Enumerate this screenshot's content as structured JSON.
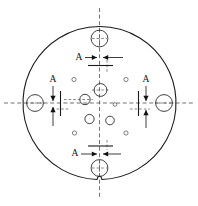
{
  "drawing": {
    "title": "Circular flange hole-pattern section drawing",
    "canvas": {
      "width": 198,
      "height": 206,
      "background": "#ffffff"
    },
    "colors": {
      "outline": "#1a1a1a",
      "hole": "#2b2b2b",
      "small_hole": "#555555",
      "centerline": "#444444",
      "arrow": "#111111",
      "text": "#111111"
    },
    "outer_circle": {
      "name": "flange-outline",
      "cx": 99.5,
      "cy": 103,
      "r": 76.5,
      "notch": {
        "present": true,
        "position": "bottom",
        "width": 5,
        "depth": 3
      }
    },
    "centerlines": {
      "horizontal": {
        "y": 103,
        "x1": 4,
        "x2": 195
      },
      "vertical": {
        "x": 99.5,
        "y1": 8,
        "y2": 199
      }
    },
    "medium_holes": [
      {
        "name": "hole-top",
        "cx": 99.5,
        "cy": 38.5,
        "r": 8.4
      },
      {
        "name": "hole-left",
        "cx": 35.0,
        "cy": 103.0,
        "r": 8.4
      },
      {
        "name": "hole-right",
        "cx": 164.0,
        "cy": 103.0,
        "r": 8.4
      },
      {
        "name": "hole-bottom",
        "cx": 99.5,
        "cy": 168.0,
        "r": 8.4
      },
      {
        "name": "hole-center",
        "cx": 100.5,
        "cy": 90.0,
        "r": 6.4
      },
      {
        "name": "hole-mid-left",
        "cx": 85.0,
        "cy": 99.5,
        "r": 5.2
      },
      {
        "name": "hole-lower-left",
        "cx": 89.5,
        "cy": 119.0,
        "r": 4.6
      },
      {
        "name": "hole-lower-right",
        "cx": 110.0,
        "cy": 120.5,
        "r": 4.3
      }
    ],
    "small_holes": [
      {
        "name": "small-hole-upper-left",
        "cx": 74.0,
        "cy": 79.5,
        "r": 2.1
      },
      {
        "name": "small-hole-upper-right",
        "cx": 126.0,
        "cy": 79.5,
        "r": 2.1
      },
      {
        "name": "small-hole-mid-right",
        "cx": 115.0,
        "cy": 104.5,
        "r": 1.8
      },
      {
        "name": "small-hole-lower-left",
        "cx": 74.5,
        "cy": 133.0,
        "r": 2.1
      },
      {
        "name": "small-hole-lower-right",
        "cx": 126.0,
        "cy": 133.0,
        "r": 2.1
      }
    ],
    "section_marks": [
      {
        "name": "section-mark-top",
        "label": "A",
        "label_x": 79,
        "label_y": 57.5,
        "orientation": "horizontal",
        "cut_line": {
          "x1": 88,
          "y1": 65.5,
          "x2": 113,
          "y2": 65.5
        },
        "arrows": [
          {
            "name": "arrow-top-left",
            "dir": "right",
            "tip_x": 97,
            "tip_y": 57.5
          },
          {
            "name": "arrow-top-right",
            "dir": "left",
            "tip_x": 103,
            "tip_y": 57.5
          }
        ],
        "leaders": [
          {
            "x1": 85,
            "y1": 57.5,
            "x2": 97,
            "y2": 57.5
          },
          {
            "x1": 103,
            "y1": 57.5,
            "x2": 123,
            "y2": 57.5
          }
        ]
      },
      {
        "name": "section-mark-left",
        "label": "A",
        "label_x": 53,
        "label_y": 80,
        "orientation": "vertical",
        "cut_line": {
          "x1": 60.5,
          "y1": 91,
          "x2": 60.5,
          "y2": 116
        },
        "arrows": [
          {
            "name": "arrow-left-upper",
            "dir": "down",
            "tip_x": 53,
            "tip_y": 101
          },
          {
            "name": "arrow-left-lower",
            "dir": "up",
            "tip_x": 53,
            "tip_y": 107
          }
        ],
        "leaders": [
          {
            "x1": 53,
            "y1": 86,
            "x2": 53,
            "y2": 101
          },
          {
            "x1": 53,
            "y1": 107,
            "x2": 53,
            "y2": 126
          }
        ]
      },
      {
        "name": "section-mark-right",
        "label": "A",
        "label_x": 146,
        "label_y": 80,
        "orientation": "vertical",
        "cut_line": {
          "x1": 138.5,
          "y1": 91,
          "x2": 138.5,
          "y2": 116
        },
        "arrows": [
          {
            "name": "arrow-right-upper",
            "dir": "down",
            "tip_x": 146,
            "tip_y": 101
          },
          {
            "name": "arrow-right-lower",
            "dir": "up",
            "tip_x": 146,
            "tip_y": 110
          }
        ],
        "leaders": [
          {
            "x1": 146,
            "y1": 86,
            "x2": 146,
            "y2": 101
          },
          {
            "x1": 146,
            "y1": 110,
            "x2": 146,
            "y2": 128
          }
        ]
      },
      {
        "name": "section-mark-bottom",
        "label": "A",
        "label_x": 75,
        "label_y": 154,
        "orientation": "horizontal",
        "cut_line": {
          "x1": 88,
          "y1": 146,
          "x2": 113,
          "y2": 146
        },
        "arrows": [
          {
            "name": "arrow-bottom-left",
            "dir": "right",
            "tip_x": 97,
            "tip_y": 154
          },
          {
            "name": "arrow-bottom-right",
            "dir": "left",
            "tip_x": 103,
            "tip_y": 154
          }
        ],
        "leaders": [
          {
            "x1": 81,
            "y1": 154,
            "x2": 97,
            "y2": 154
          },
          {
            "x1": 103,
            "y1": 154,
            "x2": 121,
            "y2": 154
          }
        ]
      }
    ],
    "short_centerlines": [
      {
        "name": "cl-top-hole-v",
        "x1": 99.5,
        "y1": 30,
        "x2": 99.5,
        "y2": 47
      },
      {
        "name": "cl-top-hole-h",
        "x1": 92,
        "y1": 38.5,
        "x2": 107,
        "y2": 38.5
      },
      {
        "name": "cl-bottom-hole-v",
        "x1": 99.5,
        "y1": 160,
        "x2": 99.5,
        "y2": 177
      },
      {
        "name": "cl-bottom-hole-h",
        "x1": 92,
        "y1": 168,
        "x2": 107,
        "y2": 168
      },
      {
        "name": "cl-left-hole-h",
        "x1": 26,
        "y1": 103,
        "x2": 45,
        "y2": 103
      },
      {
        "name": "cl-right-hole-h",
        "x1": 155,
        "y1": 103,
        "x2": 174,
        "y2": 103
      },
      {
        "name": "cl-center-hole-h",
        "x1": 92,
        "y1": 90,
        "x2": 110,
        "y2": 90
      },
      {
        "name": "cl-mid-left-h",
        "x1": 64,
        "y1": 99.5,
        "x2": 93,
        "y2": 99.5
      },
      {
        "name": "cl-sec-left-h",
        "x1": 52,
        "y1": 109,
        "x2": 70,
        "y2": 109
      },
      {
        "name": "cl-sec-right-h",
        "x1": 130,
        "y1": 109,
        "x2": 150,
        "y2": 109
      },
      {
        "name": "cl-sec-top-v",
        "x1": 107,
        "y1": 60,
        "x2": 107,
        "y2": 72
      },
      {
        "name": "cl-sec-bottom-v",
        "x1": 107,
        "y1": 140,
        "x2": 107,
        "y2": 150
      }
    ]
  }
}
